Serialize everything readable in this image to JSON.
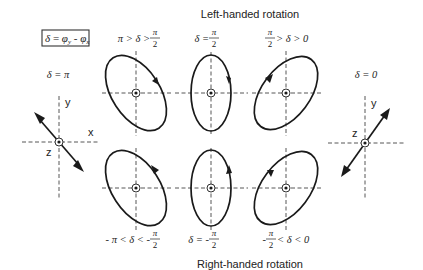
{
  "diagram": {
    "title_top": "Left-handed rotation",
    "title_bottom": "Right-handed rotation",
    "definition_box": {
      "delta": "δ",
      "equals": " = ",
      "phi_y": "φ",
      "sub_y": "y",
      "minus": " - ",
      "phi_x": "φ",
      "sub_x": "x"
    },
    "linear_left": {
      "label": "δ = π",
      "axis_y": "y",
      "axis_x": "x",
      "axis_z": "z"
    },
    "linear_right": {
      "label": "δ = 0",
      "axis_y": "y",
      "axis_z": "z"
    },
    "top_row": [
      {
        "label_left": "π > δ > ",
        "frac_num": "π",
        "frac_den": "2",
        "label_right": "",
        "rotation": "clockwise"
      },
      {
        "label_left": "δ = ",
        "frac_num": "π",
        "frac_den": "2",
        "label_right": "",
        "rotation": "clockwise"
      },
      {
        "label_left": "",
        "frac_num": "π",
        "frac_den": "2",
        "label_right": " > δ > 0",
        "rotation": "counterclockwise"
      }
    ],
    "bottom_row": [
      {
        "label_left": "- π < δ < - ",
        "frac_num": "π",
        "frac_den": "2",
        "label_right": "",
        "rotation": "counterclockwise"
      },
      {
        "label_left": "δ = - ",
        "frac_num": "π",
        "frac_den": "2",
        "label_right": "",
        "rotation": "counterclockwise"
      },
      {
        "label_left": "- ",
        "frac_num": "π",
        "frac_den": "2",
        "label_right": " < δ < 0",
        "rotation": "clockwise"
      }
    ],
    "colors": {
      "line": "#1a1a1a",
      "axis": "#444444",
      "background": "#ffffff"
    }
  }
}
